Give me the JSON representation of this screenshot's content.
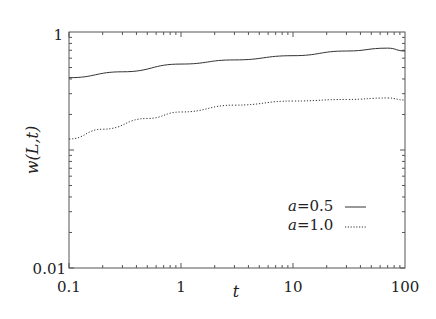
{
  "chart_data": {
    "type": "line",
    "title": "",
    "xlabel": "t",
    "ylabel": "w(L,t)",
    "xscale": "log",
    "yscale": "log",
    "xlim": [
      0.1,
      100
    ],
    "ylim": [
      0.01,
      1
    ],
    "x_ticks": [
      "0.1",
      "1",
      "10",
      "100"
    ],
    "y_ticks": [
      "0.01",
      "1"
    ],
    "grid": false,
    "legend_position": "lower right",
    "series": [
      {
        "name": "a=0.5",
        "style": "solid",
        "x": [
          0.1,
          0.3,
          1,
          3,
          10,
          30,
          70,
          100
        ],
        "values": [
          0.41,
          0.46,
          0.535,
          0.58,
          0.63,
          0.69,
          0.73,
          0.69
        ]
      },
      {
        "name": "a=1.0",
        "style": "dotted",
        "x": [
          0.1,
          0.2,
          0.5,
          1,
          3,
          10,
          30,
          70,
          100
        ],
        "values": [
          0.124,
          0.15,
          0.185,
          0.21,
          0.24,
          0.26,
          0.268,
          0.276,
          0.265
        ]
      }
    ]
  },
  "plot": {
    "xlabel": "t",
    "ylabel": "w(L,t)",
    "x_tick_labels": [
      "0.1",
      "1",
      "10",
      "100"
    ],
    "y_tick_labels": [
      "1",
      "0.01"
    ],
    "legend": [
      {
        "label": "a=0.5",
        "symbol": "a",
        "value": "=0.5",
        "style": "solid"
      },
      {
        "label": "a=1.0",
        "symbol": "a",
        "value": "=1.0",
        "style": "dotted"
      }
    ]
  }
}
